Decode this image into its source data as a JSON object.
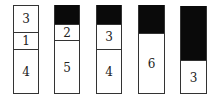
{
  "columns": [
    {
      "id": "c1",
      "left": 13,
      "top": 5,
      "width": 26,
      "height": 89,
      "segments": [
        {
          "label": "3",
          "top": 0,
          "height": 27,
          "fill": "white"
        },
        {
          "label": "1",
          "top": 27,
          "height": 17,
          "fill": "white"
        },
        {
          "label": "4",
          "top": 44,
          "height": 45,
          "fill": "white"
        }
      ]
    },
    {
      "id": "c2",
      "left": 54,
      "top": 5,
      "width": 26,
      "height": 89,
      "segments": [
        {
          "label": "",
          "top": 0,
          "height": 19,
          "fill": "black"
        },
        {
          "label": "2",
          "top": 19,
          "height": 16,
          "fill": "white"
        },
        {
          "label": "5",
          "top": 35,
          "height": 54,
          "fill": "white"
        }
      ]
    },
    {
      "id": "c3",
      "left": 96,
      "top": 5,
      "width": 26,
      "height": 89,
      "segments": [
        {
          "label": "",
          "top": 0,
          "height": 19,
          "fill": "black"
        },
        {
          "label": "3",
          "top": 19,
          "height": 25,
          "fill": "white"
        },
        {
          "label": "4",
          "top": 44,
          "height": 45,
          "fill": "white"
        }
      ]
    },
    {
      "id": "c4",
      "left": 138,
      "top": 5,
      "width": 27,
      "height": 89,
      "segments": [
        {
          "label": "",
          "top": 0,
          "height": 28,
          "fill": "black"
        },
        {
          "label": "6",
          "top": 28,
          "height": 61,
          "fill": "white"
        }
      ]
    },
    {
      "id": "c5",
      "left": 180,
      "top": 6,
      "width": 27,
      "height": 88,
      "segments": [
        {
          "label": "",
          "top": 0,
          "height": 54,
          "fill": "black"
        },
        {
          "label": "3",
          "top": 54,
          "height": 34,
          "fill": "white"
        }
      ]
    }
  ]
}
